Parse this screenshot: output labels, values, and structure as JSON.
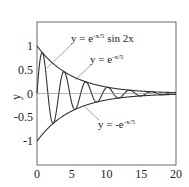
{
  "chart_data": {
    "type": "line",
    "title": "",
    "xlabel": "",
    "ylabel": "y",
    "xlim": [
      0,
      20
    ],
    "ylim": [
      -1.5,
      1.5
    ],
    "grid": false,
    "x_ticks": [
      "0",
      "5",
      "10",
      "15",
      "20"
    ],
    "y_ticks": [
      "1",
      "0.5",
      "0",
      "-0.5",
      "-1"
    ],
    "series": [
      {
        "name": "y = e^{-x/5} sin 2x",
        "function": "exp(-x/5)*sin(2x)"
      },
      {
        "name": "y = e^{-x/5}",
        "function": "exp(-x/5)"
      },
      {
        "name": "y = -e^{-x/5}",
        "function": "-exp(-x/5)"
      },
      {
        "name": "y = 0",
        "function": "0"
      }
    ],
    "annotations": [
      {
        "text": "y = e^{-x/5} sin 2x",
        "label": "y = e",
        "sup": "-x/5",
        "suffix": " sin 2x"
      },
      {
        "text": "y = e^{-x/5}",
        "label": "y = e",
        "sup": "-x/5",
        "suffix": ""
      },
      {
        "text": "y = -e^{-x/5}",
        "label": "y = -e",
        "sup": "-x/5",
        "suffix": ""
      }
    ]
  }
}
